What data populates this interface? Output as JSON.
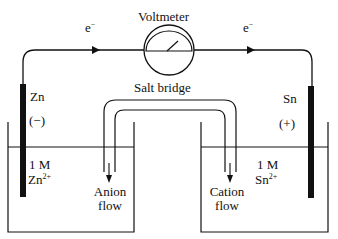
{
  "diagram": {
    "type": "galvanic-cell",
    "voltmeter": {
      "label": "Voltmeter"
    },
    "wire": {
      "left_electron_label": "e",
      "right_electron_label": "e",
      "electron_superscript": "−"
    },
    "salt_bridge": {
      "label": "Salt bridge"
    },
    "left_half_cell": {
      "electrode": "Zn",
      "polarity": "(−)",
      "concentration": "1 M",
      "ion_base": "Zn",
      "ion_charge": "2+",
      "flow_label_line1": "Anion",
      "flow_label_line2": "flow"
    },
    "right_half_cell": {
      "electrode": "Sn",
      "polarity": "(+)",
      "concentration": "1 M",
      "ion_base": "Sn",
      "ion_charge": "2+",
      "flow_label_line1": "Cation",
      "flow_label_line2": "flow"
    },
    "colors": {
      "line": "#111111",
      "electrode": "#111111",
      "background": "#ffffff"
    }
  }
}
